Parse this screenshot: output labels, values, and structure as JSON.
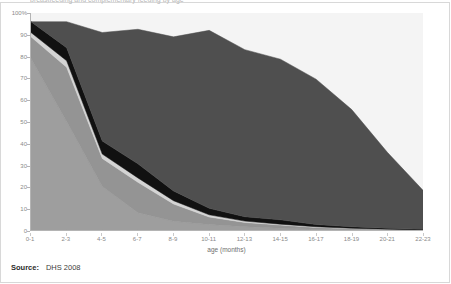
{
  "figure": {
    "title_cropped": "breastfeeding and complementary feeding by age",
    "source_label": "Source:",
    "source_value": "DHS 2008"
  },
  "chart_data": {
    "type": "area",
    "stacked": true,
    "title": "",
    "xlabel": "age (months)",
    "ylabel": "",
    "ylim": [
      0,
      100
    ],
    "ytick_labels": [
      "0",
      "10",
      "20",
      "30",
      "40",
      "50",
      "60",
      "70",
      "80",
      "90",
      "100%"
    ],
    "ytick_values": [
      0,
      10,
      20,
      30,
      40,
      50,
      60,
      70,
      80,
      90,
      100
    ],
    "grid": false,
    "legend": "none",
    "categories": [
      "0-1",
      "2-3",
      "4-5",
      "6-7",
      "8-9",
      "10-11",
      "12-13",
      "14-15",
      "16-17",
      "18-19",
      "20-21",
      "22-23"
    ],
    "series": [
      {
        "name": "exclusively breastfed",
        "color": "#9e9e9e",
        "values": [
          79,
          50,
          20,
          8,
          4,
          2.5,
          1.5,
          0.8,
          0.4,
          0.2,
          0.1,
          0
        ]
      },
      {
        "name": "breastfed and plain water only",
        "color": "#949494",
        "values": [
          10,
          25,
          13,
          14,
          8,
          3.5,
          2,
          1.5,
          0.8,
          0.4,
          0.2,
          0
        ]
      },
      {
        "name": "breastfed and non-milk liquids",
        "color": "#d4d4d4",
        "values": [
          2,
          3,
          2,
          2,
          1.5,
          1,
          0.6,
          0.4,
          0.3,
          0.2,
          0.1,
          0
        ]
      },
      {
        "name": "breastfed and other milk",
        "color": "#111111",
        "values": [
          5,
          6,
          6,
          6.5,
          4.5,
          3,
          2,
          2,
          1,
          0.7,
          0.4,
          0.3
        ]
      },
      {
        "name": "breastfed and complementary foods",
        "color": "#4f4f4f",
        "values": [
          0,
          12,
          50,
          62,
          71,
          82,
          77,
          74,
          67,
          54,
          35,
          18
        ]
      }
    ],
    "stack_tops": [
      96,
      96,
      91,
      92.5,
      89,
      92,
      83,
      78.7,
      69.5,
      55.5,
      35.8,
      18.3
    ]
  },
  "colors": {
    "plot_background": "#f4f4f4",
    "axis": "#b4b4b4",
    "tick_text": "#8a8a8a",
    "frame": "#d8d8d8"
  }
}
